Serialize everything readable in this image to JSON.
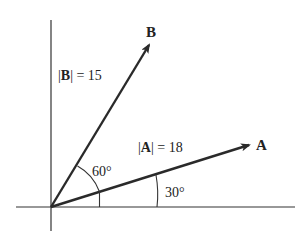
{
  "diagram": {
    "vectors": [
      {
        "id": "A",
        "name": "A",
        "magnitude_label": "|A| = 18",
        "magnitude": 18,
        "angle_deg": 30
      },
      {
        "id": "B",
        "name": "B",
        "magnitude_label": "|B| = 15",
        "magnitude": 15,
        "angle_deg": 90
      }
    ],
    "angle_labels": {
      "between_A_B": "60°",
      "A_from_x": "30°"
    },
    "labels": {
      "vecA_name": "A",
      "vecB_name": "B",
      "magA_bar_open": "|",
      "magA_letter": "A",
      "magA_rest": "| = 18",
      "magB_bar_open": "|",
      "magB_letter": "B",
      "magB_rest": "| = 15"
    }
  }
}
